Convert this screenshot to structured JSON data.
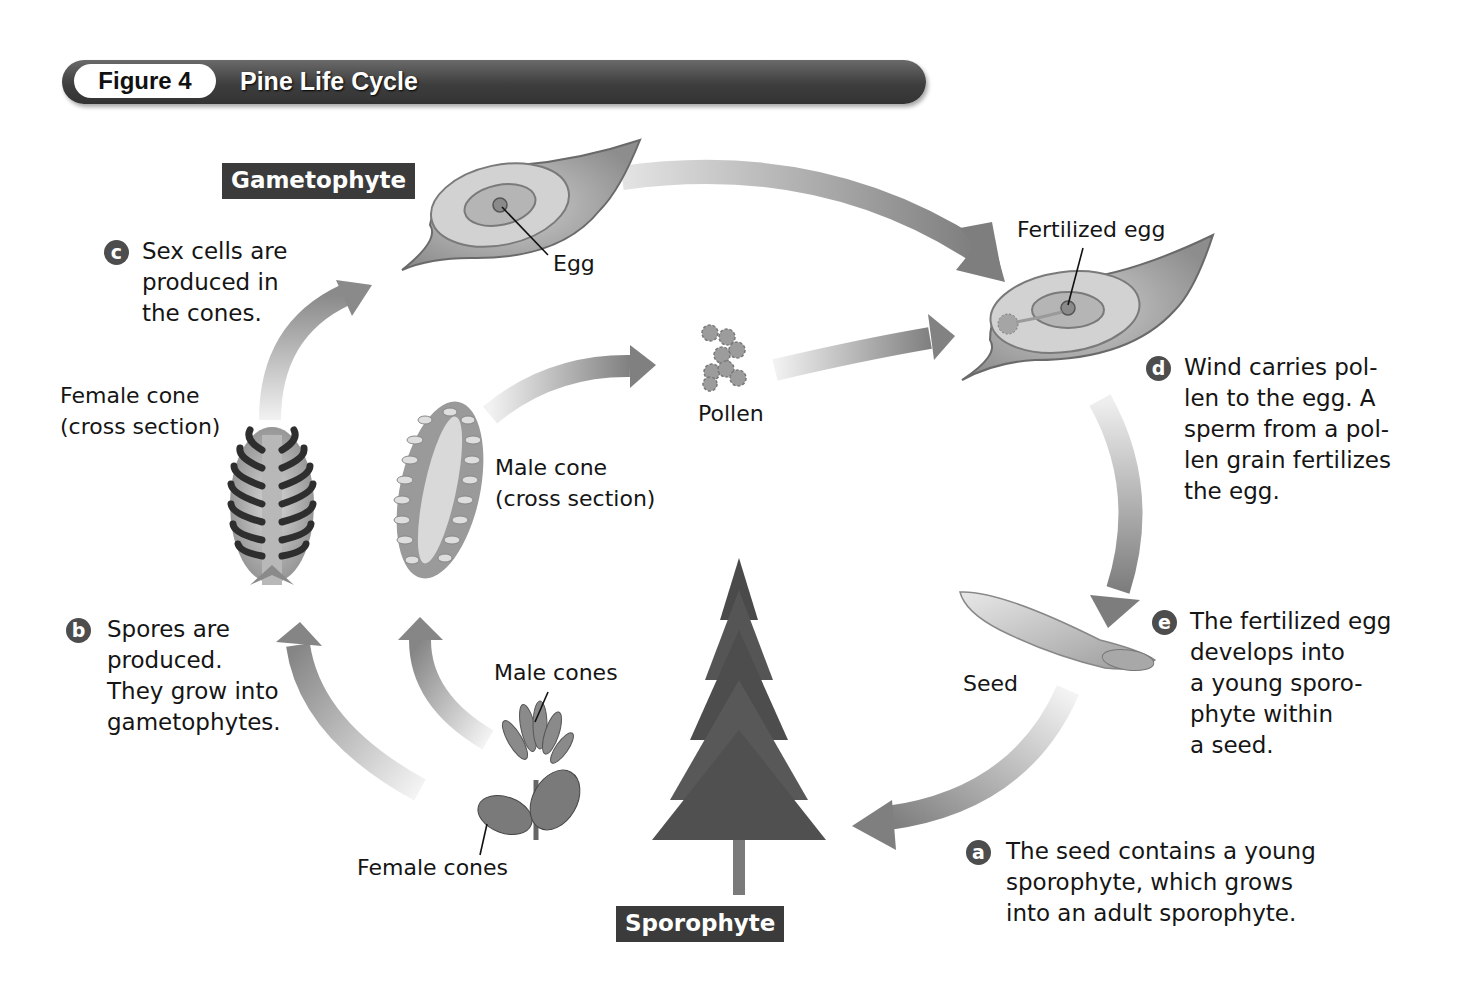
{
  "figure": {
    "number_label": "Figure 4",
    "title": "Pine Life Cycle"
  },
  "stages": {
    "gametophyte": "Gametophyte",
    "sporophyte": "Sporophyte"
  },
  "labels": {
    "egg": "Egg",
    "fertilized_egg": "Fertilized egg",
    "pollen": "Pollen",
    "female_cone_cross_section": "Female cone\n(cross section)",
    "male_cone_cross_section": "Male cone\n(cross section)",
    "male_cones": "Male cones",
    "female_cones": "Female cones",
    "seed": "Seed"
  },
  "steps": [
    {
      "letter": "a",
      "text": "The seed contains a young\nsporophyte, which grows\ninto an adult sporophyte."
    },
    {
      "letter": "b",
      "text": "Spores are\nproduced.\nThey grow into\ngametophytes."
    },
    {
      "letter": "c",
      "text": "Sex cells are\nproduced in\nthe cones."
    },
    {
      "letter": "d",
      "text": "Wind carries pol-\nlen to the egg. A\nsperm from a pol-\nlen grain fertilizes\nthe egg."
    },
    {
      "letter": "e",
      "text": "The fertilized egg\ndevelops into\na young sporo-\nphyte within\na seed."
    }
  ],
  "colors": {
    "title_bar": "#3e3e3e",
    "stage_label_bg": "#3b3b3b",
    "badge_bg": "#4d4d4d",
    "arrow": "#8a8a8a"
  }
}
